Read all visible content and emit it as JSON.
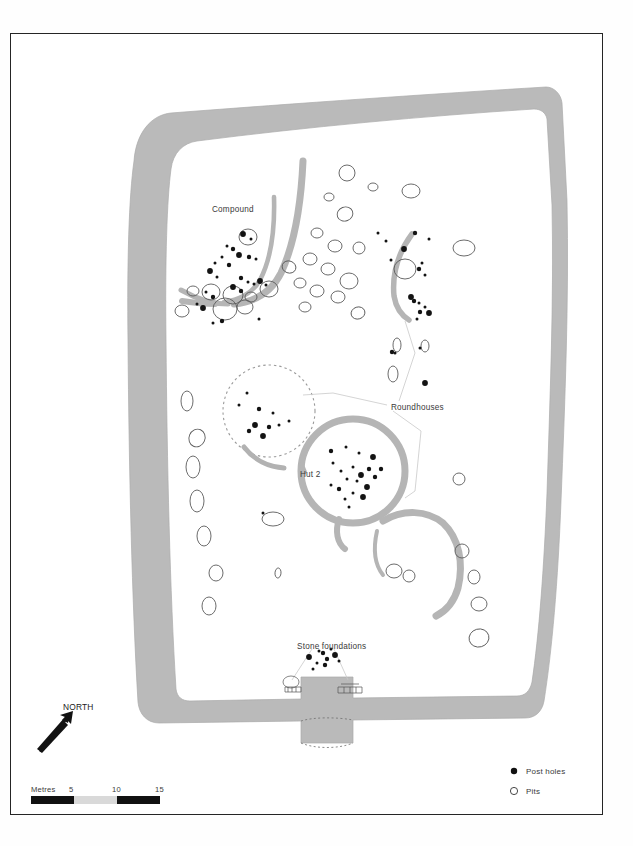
{
  "figure": {
    "type": "archaeological-site-plan",
    "background_color": "#ffffff",
    "frame_color": "#252525",
    "enclosure_fill": "#b9b9b9",
    "feature_stroke": "#4a4a4a",
    "posthole_fill": "#111111"
  },
  "labels": {
    "compound": "Compound",
    "roundhouses": "Roundhouses",
    "hut2": "Hut 2",
    "stone_foundations": "Stone foundations",
    "north": "NORTH"
  },
  "scalebar": {
    "unit_label": "Metres",
    "ticks": [
      "5",
      "10",
      "15"
    ],
    "segment_colors": [
      "#111111",
      "#d8d8d8",
      "#111111"
    ]
  },
  "legend": {
    "items": [
      {
        "symbol": "filled-dot",
        "label": "Post holes"
      },
      {
        "symbol": "open-circle",
        "label": "Pits"
      }
    ]
  },
  "chart_data": {
    "type": "map",
    "enclosure": {
      "name": "outer enclosure bank",
      "outer_path": "M 168,113 L 545,88 L 560,120 L 556,300 L 551,470 L 540,640 L 520,712 L 352,716 L 348,740 L 300,740 L 296,714 L 160,718 L 140,700 L 132,520 L 128,330 L 136,180 Z",
      "inner_path": "M 196,140 L 520,118 L 532,140 L 528,300 L 523,470 L 512,632 L 496,690 L 352,694 L 348,718 L 300,718 L 296,692 L 176,696 L 164,680 L 158,520 L 154,330 L 162,186 Z",
      "entrance_gap": {
        "x1": 300,
        "y1": 714,
        "x2": 348,
        "y2": 714
      }
    },
    "ditch_arcs": [
      {
        "name": "compound-ditch-main",
        "d": "M 300,160 C 296,200 290,240 278,270 C 268,292 252,300 232,302"
      },
      {
        "name": "compound-ditch-inner",
        "d": "M 272,196 C 272,228 268,258 258,278 C 250,292 236,298 222,300"
      },
      {
        "name": "compound-ditch-west",
        "d": "M 226,302 C 208,302 192,296 178,288"
      },
      {
        "name": "roundhouse-ne-arc",
        "d": "M 410,232 C 396,250 390,272 392,294 C 394,306 400,314 408,318"
      },
      {
        "name": "roundhouse-ring-hut2",
        "d": "M 300,470 A 52,52 0 1 1 404,470 A 52,52 0 1 1 300,470"
      },
      {
        "name": "roundhouse-se-arc",
        "d": "M 380,520 C 400,508 424,508 440,520 C 456,534 462,560 456,586 C 452,600 444,610 434,614"
      },
      {
        "name": "hut2-porch",
        "d": "M 356,522 C 352,540 352,556 358,568"
      },
      {
        "name": "dashed-house-arc",
        "d": "M 244,448 C 254,460 268,466 282,466"
      }
    ],
    "projected_circle": {
      "cx": 268,
      "cy": 410,
      "r": 46,
      "style": "dashed"
    },
    "leader_lines": [
      {
        "name": "roundhouses-leader-1",
        "d": "M 388,403 L 330,392 L 300,394"
      },
      {
        "name": "roundhouses-leader-2",
        "d": "M 392,408 L 420,428 L 412,490 L 404,496"
      },
      {
        "name": "roundhouses-leader-3",
        "d": "M 398,400 L 414,352 L 404,318"
      },
      {
        "name": "stone-leader-left",
        "d": "M 310,648 L 290,678"
      },
      {
        "name": "stone-leader-right",
        "d": "M 332,648 L 346,678"
      }
    ],
    "postholes": [
      [
        242,
        233
      ],
      [
        250,
        238
      ],
      [
        226,
        245
      ],
      [
        232,
        248
      ],
      [
        221,
        256
      ],
      [
        238,
        254
      ],
      [
        248,
        256
      ],
      [
        255,
        258
      ],
      [
        214,
        262
      ],
      [
        228,
        264
      ],
      [
        209,
        270
      ],
      [
        216,
        276
      ],
      [
        240,
        277
      ],
      [
        247,
        281
      ],
      [
        253,
        283
      ],
      [
        259,
        280
      ],
      [
        265,
        284
      ],
      [
        205,
        291
      ],
      [
        212,
        296
      ],
      [
        196,
        303
      ],
      [
        202,
        307
      ],
      [
        221,
        320
      ],
      [
        212,
        322
      ],
      [
        258,
        318
      ],
      [
        240,
        290
      ],
      [
        232,
        286
      ],
      [
        377,
        232
      ],
      [
        414,
        232
      ],
      [
        385,
        240
      ],
      [
        428,
        238
      ],
      [
        403,
        248
      ],
      [
        390,
        259
      ],
      [
        421,
        262
      ],
      [
        418,
        268
      ],
      [
        424,
        274
      ],
      [
        410,
        296
      ],
      [
        413,
        300
      ],
      [
        418,
        302
      ],
      [
        424,
        306
      ],
      [
        419,
        311
      ],
      [
        428,
        312
      ],
      [
        416,
        318
      ],
      [
        391,
        351
      ],
      [
        394,
        352
      ],
      [
        419,
        347
      ],
      [
        424,
        382
      ],
      [
        246,
        392
      ],
      [
        238,
        404
      ],
      [
        258,
        408
      ],
      [
        272,
        412
      ],
      [
        254,
        424
      ],
      [
        268,
        426
      ],
      [
        278,
        424
      ],
      [
        288,
        420
      ],
      [
        248,
        430
      ],
      [
        262,
        435
      ],
      [
        262,
        512
      ],
      [
        330,
        450
      ],
      [
        345,
        446
      ],
      [
        358,
        452
      ],
      [
        372,
        456
      ],
      [
        332,
        462
      ],
      [
        352,
        466
      ],
      [
        368,
        468
      ],
      [
        340,
        470
      ],
      [
        360,
        474
      ],
      [
        380,
        468
      ],
      [
        346,
        478
      ],
      [
        356,
        480
      ],
      [
        374,
        476
      ],
      [
        366,
        486
      ],
      [
        330,
        484
      ],
      [
        338,
        488
      ],
      [
        352,
        492
      ],
      [
        344,
        498
      ],
      [
        362,
        496
      ],
      [
        348,
        506
      ],
      [
        318,
        650
      ],
      [
        322,
        652
      ],
      [
        330,
        648
      ],
      [
        334,
        654
      ],
      [
        326,
        658
      ],
      [
        338,
        660
      ],
      [
        316,
        662
      ],
      [
        324,
        664
      ],
      [
        308,
        656
      ],
      [
        312,
        668
      ]
    ],
    "pits": [
      {
        "cx": 346,
        "cy": 172,
        "rx": 8,
        "ry": 8
      },
      {
        "cx": 410,
        "cy": 190,
        "rx": 9,
        "ry": 7
      },
      {
        "cx": 328,
        "cy": 196,
        "rx": 5,
        "ry": 4
      },
      {
        "cx": 344,
        "cy": 213,
        "rx": 8,
        "ry": 7
      },
      {
        "cx": 247,
        "cy": 236,
        "rx": 9,
        "ry": 8
      },
      {
        "cx": 316,
        "cy": 232,
        "rx": 6,
        "ry": 5
      },
      {
        "cx": 334,
        "cy": 245,
        "rx": 7,
        "ry": 6
      },
      {
        "cx": 358,
        "cy": 247,
        "rx": 6,
        "ry": 6
      },
      {
        "cx": 463,
        "cy": 247,
        "rx": 11,
        "ry": 8
      },
      {
        "cx": 309,
        "cy": 258,
        "rx": 7,
        "ry": 6
      },
      {
        "cx": 288,
        "cy": 266,
        "rx": 7,
        "ry": 6
      },
      {
        "cx": 327,
        "cy": 268,
        "rx": 7,
        "ry": 6
      },
      {
        "cx": 348,
        "cy": 280,
        "rx": 9,
        "ry": 8
      },
      {
        "cx": 299,
        "cy": 282,
        "rx": 6,
        "ry": 5
      },
      {
        "cx": 316,
        "cy": 290,
        "rx": 7,
        "ry": 6
      },
      {
        "cx": 337,
        "cy": 296,
        "rx": 7,
        "ry": 6
      },
      {
        "cx": 268,
        "cy": 288,
        "rx": 9,
        "ry": 8
      },
      {
        "cx": 232,
        "cy": 294,
        "rx": 10,
        "ry": 9
      },
      {
        "cx": 210,
        "cy": 291,
        "rx": 9,
        "ry": 8
      },
      {
        "cx": 192,
        "cy": 290,
        "rx": 6,
        "ry": 5
      },
      {
        "cx": 224,
        "cy": 308,
        "rx": 12,
        "ry": 11
      },
      {
        "cx": 244,
        "cy": 306,
        "rx": 8,
        "ry": 7
      },
      {
        "cx": 250,
        "cy": 296,
        "rx": 6,
        "ry": 5
      },
      {
        "cx": 181,
        "cy": 310,
        "rx": 7,
        "ry": 6
      },
      {
        "cx": 357,
        "cy": 312,
        "rx": 7,
        "ry": 6
      },
      {
        "cx": 304,
        "cy": 306,
        "rx": 6,
        "ry": 5
      },
      {
        "cx": 404,
        "cy": 268,
        "rx": 11,
        "ry": 10
      },
      {
        "cx": 396,
        "cy": 344,
        "rx": 4,
        "ry": 7
      },
      {
        "cx": 424,
        "cy": 345,
        "rx": 4,
        "ry": 6
      },
      {
        "cx": 392,
        "cy": 373,
        "rx": 5,
        "ry": 8
      },
      {
        "cx": 186,
        "cy": 400,
        "rx": 6,
        "ry": 10
      },
      {
        "cx": 196,
        "cy": 437,
        "rx": 8,
        "ry": 9
      },
      {
        "cx": 192,
        "cy": 466,
        "rx": 7,
        "ry": 11
      },
      {
        "cx": 196,
        "cy": 500,
        "rx": 7,
        "ry": 11
      },
      {
        "cx": 203,
        "cy": 535,
        "rx": 7,
        "ry": 10
      },
      {
        "cx": 215,
        "cy": 572,
        "rx": 7,
        "ry": 8
      },
      {
        "cx": 208,
        "cy": 605,
        "rx": 7,
        "ry": 9
      },
      {
        "cx": 272,
        "cy": 518,
        "rx": 11,
        "ry": 7
      },
      {
        "cx": 277,
        "cy": 572,
        "rx": 3,
        "ry": 5
      },
      {
        "cx": 458,
        "cy": 478,
        "rx": 6,
        "ry": 6
      },
      {
        "cx": 461,
        "cy": 550,
        "rx": 7,
        "ry": 7
      },
      {
        "cx": 473,
        "cy": 576,
        "rx": 6,
        "ry": 7
      },
      {
        "cx": 393,
        "cy": 570,
        "rx": 8,
        "ry": 7
      },
      {
        "cx": 408,
        "cy": 575,
        "rx": 6,
        "ry": 6
      },
      {
        "cx": 478,
        "cy": 603,
        "rx": 8,
        "ry": 7
      },
      {
        "cx": 478,
        "cy": 637,
        "rx": 10,
        "ry": 9
      },
      {
        "cx": 372,
        "cy": 186,
        "rx": 5,
        "ry": 4
      }
    ],
    "stone_clusters": [
      {
        "name": "stone-cluster-west",
        "cx": 297,
        "cy": 687,
        "w": 22,
        "h": 9
      },
      {
        "name": "stone-cluster-east",
        "cx": 348,
        "cy": 688,
        "w": 24,
        "h": 8
      }
    ]
  }
}
